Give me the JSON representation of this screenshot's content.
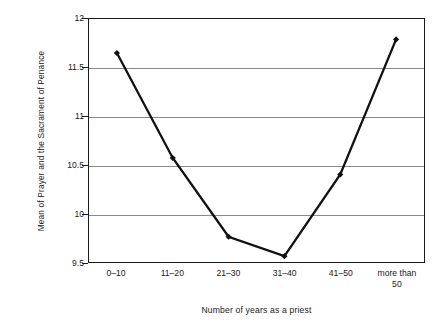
{
  "chart_data": {
    "type": "line",
    "title": "",
    "subtitle": "",
    "xlabel": "Number of years as a priest",
    "ylabel": "Mean of Prayer and the Sacrament of Penance",
    "categories": [
      "0–10",
      "11–20",
      "21–30",
      "31–40",
      "41–50",
      "more than 50"
    ],
    "category_lines": [
      [
        "0–10"
      ],
      [
        "11–20"
      ],
      [
        "21–30"
      ],
      [
        "31–40"
      ],
      [
        "41–50"
      ],
      [
        "more than",
        "50"
      ]
    ],
    "values": [
      11.65,
      10.57,
      9.76,
      9.56,
      10.4,
      11.79
    ],
    "series": [
      {
        "name": "Mean of Prayer and the Sacrament of Penance",
        "values": [
          11.65,
          10.57,
          9.76,
          9.56,
          10.4,
          11.79
        ]
      }
    ],
    "ylim": [
      9.5,
      12
    ],
    "yticks": [
      9.5,
      10,
      10.5,
      11,
      11.5,
      12
    ],
    "ytick_labels": [
      "9.5",
      "10",
      "10.5",
      "11",
      "11.5",
      "12"
    ],
    "gridlines": [
      10,
      10.5,
      11,
      11.5
    ],
    "grid": true,
    "legend": "none",
    "line_color": "#111111",
    "marker_color": "#111111",
    "marker_shape": "diamond",
    "grid_color": "#8a8a8a",
    "axis_color": "#1a1a1a",
    "background": "#ffffff"
  }
}
